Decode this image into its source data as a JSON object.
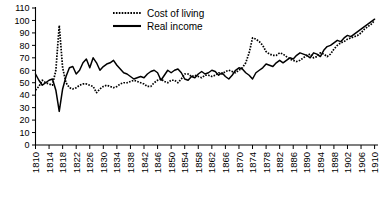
{
  "chart_data": {
    "type": "line",
    "title": "",
    "xlabel": "",
    "ylabel": "",
    "xlim": [
      1810,
      1911
    ],
    "ylim": [
      0,
      110
    ],
    "grid": false,
    "legend_position": "top-center",
    "yticks": [
      0,
      10,
      20,
      30,
      40,
      50,
      60,
      70,
      80,
      90,
      100,
      110
    ],
    "ytick_labels": [
      "0",
      "10",
      "20",
      "30",
      "40",
      "50",
      "60",
      "70",
      "80",
      "90",
      "100",
      "110"
    ],
    "xticks": [
      1810,
      1814,
      1818,
      1822,
      1826,
      1830,
      1834,
      1838,
      1842,
      1846,
      1850,
      1854,
      1858,
      1862,
      1866,
      1870,
      1874,
      1878,
      1882,
      1886,
      1890,
      1894,
      1898,
      1902,
      1906,
      1910
    ],
    "xtick_labels": [
      "1810",
      "1814",
      "1818",
      "1822",
      "1826",
      "1830",
      "1834",
      "1838",
      "1842",
      "1846",
      "1850",
      "1854",
      "1858",
      "1862",
      "1866",
      "1870",
      "1874",
      "1878",
      "1882",
      "1886",
      "1890",
      "1894",
      "1898",
      "1902",
      "1906",
      "1910"
    ],
    "x": [
      1810,
      1811,
      1812,
      1813,
      1814,
      1815,
      1816,
      1817,
      1818,
      1819,
      1820,
      1821,
      1822,
      1823,
      1824,
      1825,
      1826,
      1827,
      1828,
      1829,
      1830,
      1831,
      1832,
      1833,
      1834,
      1835,
      1836,
      1837,
      1838,
      1839,
      1840,
      1841,
      1842,
      1843,
      1844,
      1845,
      1846,
      1847,
      1848,
      1849,
      1850,
      1851,
      1852,
      1853,
      1854,
      1855,
      1856,
      1857,
      1858,
      1859,
      1860,
      1861,
      1862,
      1863,
      1864,
      1865,
      1866,
      1867,
      1868,
      1869,
      1870,
      1871,
      1872,
      1873,
      1874,
      1875,
      1876,
      1877,
      1878,
      1879,
      1880,
      1881,
      1882,
      1883,
      1884,
      1885,
      1886,
      1887,
      1888,
      1889,
      1890,
      1891,
      1892,
      1893,
      1894,
      1895,
      1896,
      1897,
      1898,
      1899,
      1900,
      1901,
      1902,
      1903,
      1904,
      1905,
      1906,
      1907,
      1908,
      1909,
      1910
    ],
    "series": [
      {
        "name": "Cost of living",
        "style": "dotted",
        "color": "#000000",
        "values": [
          44,
          47,
          52,
          50,
          49,
          48,
          60,
          96,
          62,
          50,
          46,
          45,
          46,
          48,
          49,
          49,
          48,
          47,
          42,
          45,
          47,
          48,
          47,
          46,
          47,
          49,
          50,
          50,
          51,
          52,
          51,
          50,
          49,
          47,
          47,
          50,
          52,
          53,
          51,
          50,
          52,
          52,
          50,
          53,
          57,
          57,
          55,
          56,
          55,
          54,
          56,
          56,
          55,
          56,
          58,
          57,
          59,
          60,
          59,
          58,
          60,
          62,
          66,
          74,
          86,
          85,
          83,
          80,
          75,
          73,
          72,
          72,
          74,
          73,
          71,
          69,
          68,
          67,
          68,
          70,
          72,
          73,
          70,
          71,
          74,
          73,
          71,
          73,
          77,
          80,
          82,
          83,
          85,
          86,
          87,
          88,
          90,
          93,
          95,
          97,
          100
        ]
      },
      {
        "name": "Real income",
        "style": "solid",
        "color": "#000000",
        "values": [
          57,
          52,
          48,
          50,
          52,
          53,
          44,
          27,
          45,
          55,
          62,
          63,
          57,
          60,
          66,
          69,
          62,
          70,
          66,
          60,
          63,
          65,
          66,
          68,
          64,
          61,
          58,
          57,
          55,
          53,
          54,
          55,
          54,
          57,
          59,
          60,
          58,
          52,
          56,
          60,
          58,
          60,
          61,
          58,
          53,
          52,
          55,
          54,
          57,
          59,
          57,
          58,
          60,
          59,
          56,
          58,
          55,
          53,
          56,
          60,
          62,
          61,
          58,
          56,
          53,
          58,
          60,
          62,
          65,
          64,
          63,
          66,
          68,
          66,
          68,
          70,
          69,
          72,
          74,
          73,
          72,
          70,
          74,
          73,
          71,
          76,
          79,
          80,
          82,
          84,
          83,
          86,
          88,
          87,
          89,
          91,
          93,
          95,
          97,
          99,
          101
        ]
      }
    ],
    "annotations": [
      {
        "label": "cost-of-living peak",
        "x": 1817,
        "y": 96
      },
      {
        "label": "real-income trough",
        "x": 1817,
        "y": 27
      },
      {
        "label": "cost-of-living secondary peak",
        "x": 1874,
        "y": 86
      }
    ]
  },
  "legend": {
    "items": [
      {
        "label": "Cost of living",
        "style": "dotted"
      },
      {
        "label": "Real income",
        "style": "solid"
      }
    ]
  }
}
